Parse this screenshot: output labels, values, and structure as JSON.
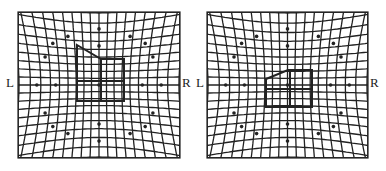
{
  "panels": [
    {
      "id": "left",
      "left_label": "L",
      "right_label": "R",
      "shape": "house-outline-large"
    },
    {
      "id": "right",
      "left_label": "L",
      "right_label": "R",
      "shape": "house-outline-small"
    }
  ],
  "style": {
    "line_color": "#222222",
    "background": "#ffffff"
  }
}
